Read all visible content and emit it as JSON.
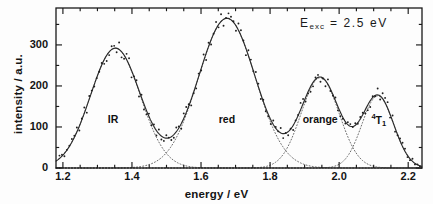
{
  "chart_data": {
    "type": "line",
    "title": "",
    "xlabel": "energy / eV",
    "ylabel": "intensity / a.u.",
    "xlim": [
      1.18,
      2.24
    ],
    "ylim": [
      0,
      390
    ],
    "xticks": [
      "1.2",
      "1.4",
      "1.6",
      "1.8",
      "2.0",
      "2.2"
    ],
    "xtick_values": [
      1.2,
      1.4,
      1.6,
      1.8,
      2.0,
      2.2
    ],
    "yticks": [
      "0",
      "100",
      "200",
      "300"
    ],
    "ytick_values": [
      0,
      100,
      200,
      300
    ],
    "xminor_step": 0.05,
    "yminor_step": 50,
    "grid": false,
    "legend": "none",
    "annotations": [
      {
        "name": "excitation-energy",
        "text": "E",
        "sub": "exc",
        "rest": " = 2.5 eV",
        "x": 2.05,
        "y": 355
      }
    ],
    "peak_labels": [
      {
        "name": "IR",
        "text": "IR",
        "x": 1.345,
        "y": 118
      },
      {
        "name": "red",
        "text": "red",
        "x": 1.675,
        "y": 118
      },
      {
        "name": "orange",
        "text": "orange",
        "x": 1.945,
        "y": 118
      },
      {
        "name": "4T1",
        "sup": "4",
        "text": "T",
        "sub": "1",
        "x": 2.115,
        "y": 120
      }
    ],
    "series": [
      {
        "name": "IR band",
        "style": "dotted-component",
        "type": "gaussian",
        "amplitude": 292,
        "center": 1.352,
        "sigma": 0.072
      },
      {
        "name": "red band",
        "style": "dotted-component",
        "type": "gaussian",
        "amplitude": 365,
        "center": 1.675,
        "sigma": 0.082
      },
      {
        "name": "orange band",
        "style": "dotted-component",
        "type": "gaussian",
        "amplitude": 220,
        "center": 1.945,
        "sigma": 0.055
      },
      {
        "name": "4T1 band",
        "style": "dotted-component",
        "type": "gaussian",
        "amplitude": 176,
        "center": 2.112,
        "sigma": 0.046
      }
    ],
    "fit_curve": {
      "name": "sum fit",
      "style": "solid",
      "description": "sum of four gaussian components"
    },
    "data_points": {
      "name": "measured spectrum",
      "style": "scatter-dots",
      "marker": "dot",
      "noise_amplitude": 13,
      "x_start": 1.19,
      "x_end": 2.235,
      "x_step": 0.0072
    }
  },
  "axes": {
    "frame": {
      "left": 1.18,
      "right": 2.24,
      "bottom": 0,
      "top": 390
    },
    "tick_direction": "in"
  },
  "colors": {
    "background": "#fdfdfd",
    "axis": "#1a1a1a",
    "fit_line": "#2b2b2b",
    "component_line": "#6d6d6d",
    "data_point": "#202020",
    "text": "#141414"
  }
}
